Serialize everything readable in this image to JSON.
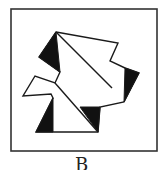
{
  "figure": {
    "label": "B",
    "frame": {
      "x": 11,
      "y": 9,
      "width": 146,
      "height": 142,
      "stroke": "#333333"
    },
    "colors": {
      "stroke": "#1a1a1a",
      "fill_white": "#ffffff",
      "fill_black": "#111111"
    },
    "outline_points": "56,32 118,43 110,61 125,68 139,73 124,102 100,107 98,132 36,132 53,98 51,94 23,96 35,76 55,83 60,72 39,57",
    "inner_lines": [
      {
        "x1": 56,
        "y1": 32,
        "x2": 112,
        "y2": 88
      },
      {
        "x1": 55,
        "y1": 83,
        "x2": 98,
        "y2": 132
      }
    ],
    "black_triangles": [
      "56,32 39,57 60,72",
      "125,68 139,73 124,102",
      "53,98 36,132 53,132",
      "80,107 100,107 98,132"
    ]
  }
}
